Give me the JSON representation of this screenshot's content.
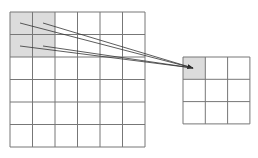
{
  "diagram": {
    "type": "pooling-illustration",
    "input_grid": {
      "rows": 6,
      "cols": 6,
      "x": 10,
      "y": 12,
      "cell": 22.5,
      "highlight": {
        "row": 0,
        "col": 0,
        "rows": 2,
        "cols": 2
      }
    },
    "output_grid": {
      "rows": 3,
      "cols": 3,
      "x": 183,
      "y": 57,
      "cell": 22.3,
      "highlight": {
        "row": 0,
        "col": 0,
        "rows": 1,
        "cols": 1
      }
    },
    "colors": {
      "grid_line": "#777777",
      "highlight": "#dcdcdc",
      "arrow": "#333333",
      "background": "#ffffff"
    }
  }
}
